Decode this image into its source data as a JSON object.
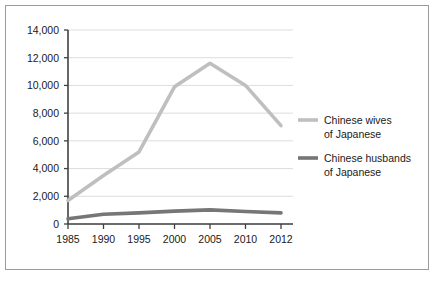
{
  "chart_data": {
    "type": "line",
    "title": "",
    "xlabel": "",
    "ylabel": "",
    "categories": [
      "1985",
      "1990",
      "1995",
      "2000",
      "2005",
      "2010",
      "2012"
    ],
    "x": [
      1985,
      1990,
      1995,
      2000,
      2005,
      2010,
      2012
    ],
    "series": [
      {
        "name": "Chinese wives of Japanese",
        "name_line1": "Chinese wives",
        "name_line2": "of Japanese",
        "color": "#bfbfbf",
        "stroke_width": 3.6,
        "values": [
          1700,
          3500,
          5200,
          9900,
          11600,
          10000,
          7100
        ]
      },
      {
        "name": "Chinese husbands of Japanese",
        "name_line1": "Chinese husbands",
        "name_line2": "of Japanese",
        "color": "#767676",
        "stroke_width": 3.6,
        "values": [
          380,
          700,
          800,
          930,
          1020,
          900,
          800
        ]
      }
    ],
    "ylim": [
      0,
      14000
    ],
    "yticks": [
      0,
      2000,
      4000,
      6000,
      8000,
      10000,
      12000,
      14000
    ],
    "ytick_labels": [
      "0",
      "2,000",
      "4,000",
      "6,000",
      "8,000",
      "10,000",
      "12,000",
      "14,000"
    ],
    "grid": true,
    "grid_color": "#d9d9d9",
    "legend_position": "right",
    "axis_color": "#404040",
    "background": "#ffffff",
    "border_color": "#9a9a9a"
  }
}
